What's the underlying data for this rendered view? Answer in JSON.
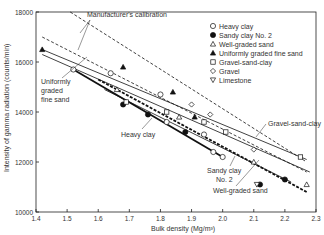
{
  "chart_data": {
    "type": "scatter",
    "title": "",
    "xlabel": "Bulk density (Mg/m³)",
    "ylabel": "Intensity of gamma radiation (counts/min)",
    "xlim": [
      1.4,
      2.3
    ],
    "ylim": [
      10000,
      18000
    ],
    "xticks": [
      "1.4",
      "1.5",
      "1.6",
      "1.7",
      "1.8",
      "1.9",
      "2.0",
      "2.1",
      "2.2",
      "2.3"
    ],
    "yticks": [
      "10000",
      "12000",
      "14000",
      "16000",
      "18000"
    ],
    "grid": false,
    "legend_position": "upper right",
    "legend": [
      {
        "label": "Heavy clay",
        "marker": "open-circle"
      },
      {
        "label": "Sandy clay No. 2",
        "marker": "filled-circle"
      },
      {
        "label": "Well-graded sand",
        "marker": "open-triangle"
      },
      {
        "label": "Uniformly graded  fine sand",
        "marker": "filled-triangle"
      },
      {
        "label": "Gravel-sand-clay",
        "marker": "open-square"
      },
      {
        "label": "Gravel",
        "marker": "open-diamond"
      },
      {
        "label": "Limestone",
        "marker": "open-down-triangle"
      }
    ],
    "lines": [
      {
        "name": "Manufacturer's calibration (upper)",
        "style": "dashed",
        "points": [
          [
            1.51,
            18000
          ],
          [
            2.27,
            12000
          ]
        ]
      },
      {
        "name": "Manufacturer's calibration (lower)",
        "style": "dashed",
        "points": [
          [
            1.42,
            17000
          ],
          [
            2.27,
            11600
          ]
        ]
      },
      {
        "name": "Uniformly graded fine sand",
        "style": "solid",
        "points": [
          [
            1.42,
            16300
          ],
          [
            2.28,
            11600
          ]
        ]
      },
      {
        "name": "Gravel-sand-clay",
        "style": "solid",
        "points": [
          [
            1.42,
            16500
          ],
          [
            2.27,
            12100
          ]
        ]
      },
      {
        "name": "Heavy clay",
        "style": "solid-thick",
        "points": [
          [
            1.52,
            15700
          ],
          [
            2.0,
            12200
          ]
        ]
      },
      {
        "name": "Sandy clay No. 2",
        "style": "solid",
        "points": [
          [
            1.62,
            14900
          ],
          [
            2.22,
            11200
          ]
        ]
      },
      {
        "name": "Well-graded sand",
        "style": "dashed-thick",
        "points": [
          [
            1.6,
            15300
          ],
          [
            2.27,
            10800
          ]
        ]
      }
    ],
    "series": [
      {
        "name": "Heavy clay",
        "points": [
          [
            1.52,
            15700
          ],
          [
            1.64,
            15550
          ],
          [
            1.8,
            14700
          ],
          [
            1.94,
            13100
          ],
          [
            1.97,
            12400
          ],
          [
            2.0,
            12200
          ],
          [
            1.82,
            13600
          ]
        ]
      },
      {
        "name": "Sandy clay No. 2",
        "points": [
          [
            1.68,
            14300
          ],
          [
            1.88,
            13200
          ],
          [
            2.12,
            11100
          ],
          [
            2.2,
            11300
          ],
          [
            1.76,
            13900
          ]
        ]
      },
      {
        "name": "Well-graded sand",
        "points": [
          [
            1.86,
            13800
          ],
          [
            2.1,
            12000
          ],
          [
            2.27,
            11100
          ],
          [
            1.66,
            14900
          ]
        ]
      },
      {
        "name": "Uniformly graded  fine sand",
        "points": [
          [
            1.42,
            16500
          ],
          [
            1.68,
            15800
          ],
          [
            1.91,
            13800
          ],
          [
            1.84,
            14800
          ]
        ]
      },
      {
        "name": "Gravel-sand-clay",
        "points": [
          [
            1.94,
            13600
          ],
          [
            2.01,
            13200
          ],
          [
            2.25,
            12200
          ],
          [
            1.82,
            14000
          ],
          [
            1.69,
            14400
          ]
        ]
      },
      {
        "name": "Gravel",
        "points": [
          [
            1.9,
            14300
          ],
          [
            1.96,
            13900
          ],
          [
            2.1,
            12500
          ]
        ]
      },
      {
        "name": "Limestone",
        "points": [
          [
            2.11,
            11100
          ]
        ]
      }
    ],
    "annotations": [
      "Manufacturer's calibration",
      "Uniformly graded fine sand",
      "Heavy clay",
      "Gravel-sand-clay",
      "Sandy clay No. 2",
      "Well-graded sand"
    ]
  },
  "labels": {
    "manufacturer": "Manufacturer's calibration",
    "uniform1": "Uniformly",
    "uniform2": "graded",
    "uniform3": "fine sand",
    "heavy": "Heavy clay",
    "gsc": "Gravel-sand-clay",
    "sandy1": "Sandy clay",
    "sandy2": "No. 2",
    "wgs": "Well-graded sand",
    "xaxis": "Bulk density (Mg/m³)",
    "yaxis": "Intensity of gamma radiation (counts/min)"
  }
}
